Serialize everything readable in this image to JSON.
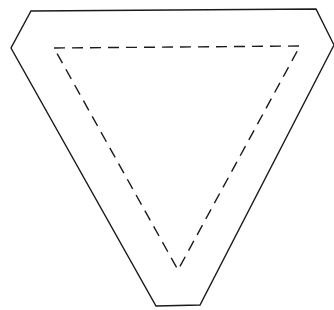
{
  "diagram": {
    "background": "#ffffff",
    "stroke_color": "#1a1a1a",
    "outer_shape": {
      "kind": "truncated-inverted-triangle",
      "style": "solid",
      "points": [
        [
          31,
          11
        ],
        [
          316,
          9
        ],
        [
          334,
          45
        ],
        [
          200,
          305
        ],
        [
          156,
          306
        ],
        [
          11,
          48
        ]
      ]
    },
    "inner_shape": {
      "kind": "inverted-triangle",
      "style": "dashed",
      "points": [
        [
          54,
          48
        ],
        [
          300,
          46
        ],
        [
          178,
          270
        ]
      ]
    }
  }
}
